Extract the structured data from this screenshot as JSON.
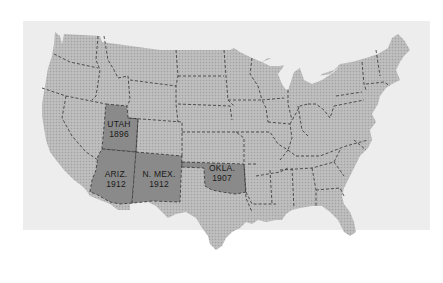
{
  "colors": {
    "background": "#ffffff",
    "panel": "#ededed",
    "land": "#b4b4b4",
    "highlight": "#8a8a8a",
    "border": "#333333",
    "label": "#1a1a1a"
  },
  "map": {
    "title": "",
    "highlighted_states": [
      {
        "name": "UTAH",
        "year": "1896"
      },
      {
        "name": "ARIZ.",
        "year": "1912"
      },
      {
        "name": "N. MEX.",
        "year": "1912"
      },
      {
        "name": "OKLA.",
        "year": "1907"
      }
    ]
  }
}
